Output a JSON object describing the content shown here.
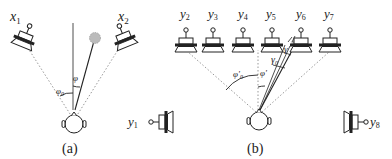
{
  "figure": {
    "panel_a": {
      "caption": "(a)",
      "speakers": [
        {
          "label": "x",
          "sub": "1"
        },
        {
          "label": "x",
          "sub": "2"
        }
      ],
      "angles": [
        {
          "symbol": "φ",
          "sub": "0"
        },
        {
          "symbol": "φ",
          "sub": ""
        }
      ],
      "virtual_source": "grey circle"
    },
    "panel_b": {
      "caption": "(b)",
      "speakers_top": [
        {
          "label": "y",
          "sub": "2"
        },
        {
          "label": "y",
          "sub": "3"
        },
        {
          "label": "y",
          "sub": "4"
        },
        {
          "label": "y",
          "sub": "5"
        },
        {
          "label": "y",
          "sub": "6"
        },
        {
          "label": "y",
          "sub": "7"
        }
      ],
      "speakers_side": [
        {
          "label": "y",
          "sub": "1"
        },
        {
          "label": "y",
          "sub": "8"
        }
      ],
      "angles": [
        {
          "symbol": "φ'",
          "sub": "0"
        },
        {
          "symbol": "φ'",
          "sub": ""
        },
        {
          "symbol": "γ",
          "sub": "0"
        },
        {
          "symbol": "γ",
          "sub": ""
        }
      ]
    },
    "colors": {
      "line": "#222222",
      "dotted": "#999999",
      "source": "#bbbbbb"
    }
  }
}
